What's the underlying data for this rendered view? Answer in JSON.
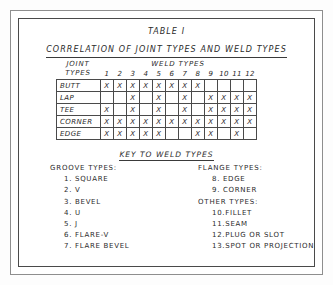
{
  "title": {
    "line1": "TABLE I",
    "line2": "CORRELATION OF JOINT TYPES AND WELD TYPES"
  },
  "matrix": {
    "row_axis_label_line1": "JOINT",
    "row_axis_label_line2": "TYPES",
    "column_axis_label": "WELD TYPES",
    "columns": [
      "1",
      "2",
      "3",
      "4",
      "5",
      "6",
      "7",
      "8",
      "9",
      "10",
      "11",
      "12"
    ],
    "mark": "X",
    "rows": [
      {
        "label": "BUTT",
        "marks": [
          true,
          true,
          true,
          true,
          true,
          true,
          true,
          true,
          false,
          false,
          false,
          false
        ]
      },
      {
        "label": "LAP",
        "marks": [
          false,
          false,
          true,
          false,
          true,
          false,
          true,
          false,
          true,
          true,
          true,
          true
        ]
      },
      {
        "label": "TEE",
        "marks": [
          true,
          false,
          true,
          false,
          true,
          false,
          true,
          false,
          true,
          true,
          true,
          true
        ]
      },
      {
        "label": "CORNER",
        "marks": [
          true,
          true,
          true,
          true,
          true,
          true,
          true,
          true,
          true,
          true,
          true,
          true
        ]
      },
      {
        "label": "EDGE",
        "marks": [
          true,
          true,
          true,
          true,
          true,
          false,
          false,
          true,
          true,
          false,
          true,
          false
        ]
      }
    ]
  },
  "key": {
    "heading": "KEY TO WELD TYPES",
    "left_column": [
      {
        "group": "GROOVE TYPES:",
        "items": [
          {
            "num": "1.",
            "label": "SQUARE"
          },
          {
            "num": "2.",
            "label": "V"
          },
          {
            "num": "3.",
            "label": "BEVEL"
          },
          {
            "num": "4.",
            "label": "U"
          },
          {
            "num": "5.",
            "label": "J"
          },
          {
            "num": "6.",
            "label": "FLARE-V"
          },
          {
            "num": "7.",
            "label": "FLARE BEVEL"
          }
        ]
      }
    ],
    "right_column": [
      {
        "group": "FLANGE TYPES:",
        "items": [
          {
            "num": "8.",
            "label": "EDGE"
          },
          {
            "num": "9.",
            "label": "CORNER"
          }
        ]
      },
      {
        "group": "OTHER TYPES:",
        "items": [
          {
            "num": "10.",
            "label": "FILLET"
          },
          {
            "num": "11.",
            "label": "SEAM"
          },
          {
            "num": "12.",
            "label": "PLUG OR SLOT"
          },
          {
            "num": "13.",
            "label": "SPOT OR PROJECTION"
          }
        ]
      }
    ]
  },
  "colors": {
    "ink": "#2b2b2b",
    "rule": "#4a4a4a",
    "outer_frame": "#8e8e8e",
    "paper": "#ffffff"
  }
}
